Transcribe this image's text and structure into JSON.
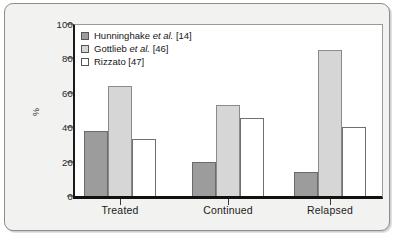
{
  "chart_data": {
    "type": "bar",
    "title": "",
    "xlabel": "",
    "ylabel": "%",
    "ylim": [
      0,
      100
    ],
    "yticks": [
      "0",
      "20",
      "40",
      "60",
      "80",
      "100"
    ],
    "grid": false,
    "legend_position": "top-left",
    "categories": [
      "Treated",
      "Continued",
      "Relapsed"
    ],
    "series": [
      {
        "name": "Hunninghake et al. [14]",
        "name_prefix": "Hunninghake ",
        "name_italic": "et al.",
        "name_suffix": " [14]",
        "color": "#9c9c9c",
        "values": [
          38,
          20,
          14
        ]
      },
      {
        "name": "Gottlieb et al. [46]",
        "name_prefix": "Gottlieb ",
        "name_italic": "et al.",
        "name_suffix": " [46]",
        "color": "#d6d6d6",
        "values": [
          64,
          53,
          85
        ]
      },
      {
        "name": "Rizzato [47]",
        "name_prefix": "Rizzato [47]",
        "name_italic": "",
        "name_suffix": "",
        "color": "#ffffff",
        "values": [
          33,
          45.5,
          40
        ]
      }
    ]
  },
  "figure": {
    "background_color": "#f2f2f0",
    "plot_background_color": "#ffffff",
    "axis_color": "#111111"
  }
}
